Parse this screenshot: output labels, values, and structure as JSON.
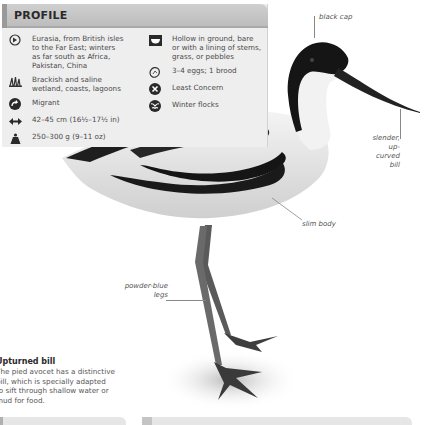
{
  "profile": {
    "title": "PROFILE",
    "left_facts": [
      {
        "icon": "globe-range-icon",
        "text": "Eurasia, from British isles\nto the Far East; winters\nas far south as Africa,\nPakistan, China"
      },
      {
        "icon": "reeds-habitat-icon",
        "text": "Brackish and saline\nwetland, coasts, lagoons"
      },
      {
        "icon": "migrant-arrow-icon",
        "text": "Migrant"
      },
      {
        "icon": "length-arrows-icon",
        "text": "42–45 cm (16½–17½ in)"
      },
      {
        "icon": "weight-icon",
        "text": "250–300 g (9–11 oz)"
      }
    ],
    "right_facts": [
      {
        "icon": "nest-icon",
        "text": "Hollow in ground, bare\nor with a lining of stems,\ngrass, or pebbles"
      },
      {
        "icon": "egg-icon",
        "text": "3–4 eggs; 1 brood"
      },
      {
        "icon": "conservation-status-icon",
        "text": "Least Concern"
      },
      {
        "icon": "social-flock-icon",
        "text": "Winter flocks"
      }
    ]
  },
  "annotations": {
    "black_cap": "black cap",
    "bill": "slender,\nup-curved\nbill",
    "body": "slim body",
    "legs": "powder-blue\nlegs"
  },
  "caption": {
    "title": "Upturned bill",
    "body": "The pied avocet has a distinctive\nbill, which is specially adapted\nto sift through shallow water or\nmud for food."
  }
}
